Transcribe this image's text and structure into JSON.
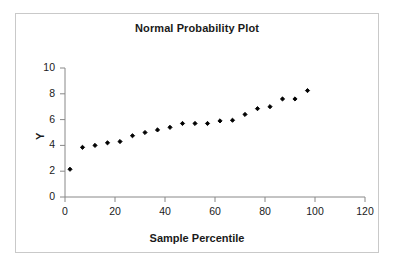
{
  "chart_data": {
    "type": "scatter",
    "title": "Normal Probability Plot",
    "xlabel": "Sample Percentile",
    "ylabel": "Y",
    "xlim": [
      0,
      120
    ],
    "ylim": [
      0,
      10
    ],
    "xticks": [
      0,
      20,
      40,
      60,
      80,
      100,
      120
    ],
    "yticks": [
      0,
      2,
      4,
      6,
      8,
      10
    ],
    "grid": false,
    "legend": "none",
    "marker": "diamond",
    "marker_color": "#000000",
    "x": [
      2,
      7,
      12,
      17,
      22,
      27,
      32,
      37,
      42,
      47,
      52,
      57,
      62,
      67,
      72,
      77,
      82,
      87,
      92,
      97
    ],
    "y": [
      2.15,
      3.85,
      4.0,
      4.2,
      4.3,
      4.75,
      5.0,
      5.2,
      5.4,
      5.7,
      5.7,
      5.7,
      5.9,
      5.95,
      6.4,
      6.85,
      7.0,
      7.6,
      7.6,
      8.25
    ],
    "points": [
      {
        "x": 2,
        "y": 2.15
      },
      {
        "x": 7,
        "y": 3.85
      },
      {
        "x": 12,
        "y": 4.0
      },
      {
        "x": 17,
        "y": 4.2
      },
      {
        "x": 22,
        "y": 4.3
      },
      {
        "x": 27,
        "y": 4.75
      },
      {
        "x": 32,
        "y": 5.0
      },
      {
        "x": 37,
        "y": 5.2
      },
      {
        "x": 42,
        "y": 5.4
      },
      {
        "x": 47,
        "y": 5.7
      },
      {
        "x": 52,
        "y": 5.7
      },
      {
        "x": 57,
        "y": 5.7
      },
      {
        "x": 62,
        "y": 5.9
      },
      {
        "x": 67,
        "y": 5.95
      },
      {
        "x": 72,
        "y": 6.4
      },
      {
        "x": 77,
        "y": 6.85
      },
      {
        "x": 82,
        "y": 7.0
      },
      {
        "x": 87,
        "y": 7.6
      },
      {
        "x": 92,
        "y": 7.6
      },
      {
        "x": 97,
        "y": 8.25
      }
    ]
  },
  "axis": {
    "color": "#888888",
    "text_color": "#1a1a1a"
  },
  "frame": {
    "border_color": "#c9c9c9",
    "background": "#ffffff"
  }
}
